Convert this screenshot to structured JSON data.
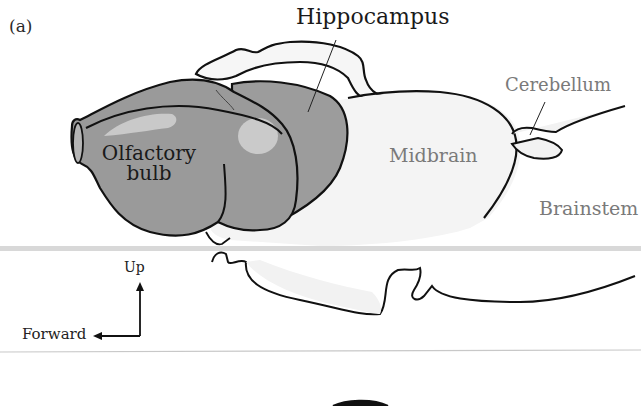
{
  "figure": {
    "panel_label": "(a)",
    "labels": {
      "hippocampus": "Hippocampus",
      "olfactory_bulb_line1": "Olfactory",
      "olfactory_bulb_line2": "bulb",
      "midbrain": "Midbrain",
      "cerebellum": "Cerebellum",
      "brainstem": "Brainstem"
    },
    "orientation": {
      "up": "Up",
      "forward": "Forward"
    },
    "colors": {
      "outline": "#111111",
      "forebrain_fill": "#9a9a9a",
      "forebrain_highlight": "#c4c4c4",
      "forebrain_shadow": "#7e7e7e",
      "hindbrain_fill": "#f4f4f4",
      "emphasis_label": "#1a1a1a",
      "muted_label": "#7a7a7a"
    }
  }
}
